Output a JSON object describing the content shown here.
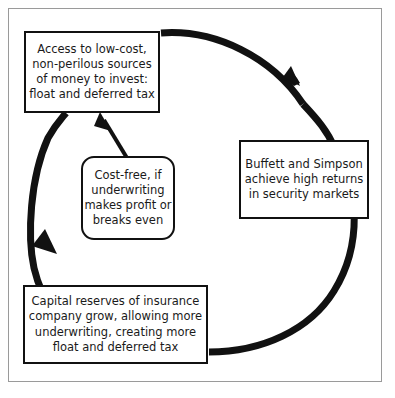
{
  "diagram": {
    "type": "cycle-diagram",
    "title": "",
    "frame_color": "#9a9a9a",
    "line_color": "#111111",
    "background": "#ffffff",
    "nodes": [
      {
        "id": "access",
        "label": "Access to low-cost,\nnon-perilous sources\nof money to invest:\nfloat and deferred tax",
        "shape": "rectangle",
        "position": "top-left"
      },
      {
        "id": "returns",
        "label": "Buffett and Simpson\nachieve high returns\nin security markets",
        "shape": "rectangle",
        "position": "right"
      },
      {
        "id": "capital",
        "label": "Capital reserves of insurance\ncompany grow, allowing more\nunderwriting, creating more\nfloat and deferred tax",
        "shape": "rectangle",
        "position": "bottom-left"
      },
      {
        "id": "costfree",
        "label": "Cost-free, if\nunderwriting\nmakes profit or\nbreaks even",
        "shape": "rounded-rectangle",
        "position": "center"
      }
    ],
    "edges": [
      {
        "id": "access-to-returns",
        "from": "access",
        "to": "returns",
        "style": "thick-clockwise-arc",
        "arrowhead": "end"
      },
      {
        "id": "returns-to-capital",
        "from": "returns",
        "to": "capital",
        "style": "thick-clockwise-arc",
        "arrowhead": "none"
      },
      {
        "id": "capital-to-access",
        "from": "capital",
        "to": "access",
        "style": "thick-clockwise-arc",
        "arrowhead": "end"
      },
      {
        "id": "costfree-to-access",
        "from": "costfree",
        "to": "access",
        "style": "straight",
        "arrowhead": "end"
      }
    ]
  }
}
